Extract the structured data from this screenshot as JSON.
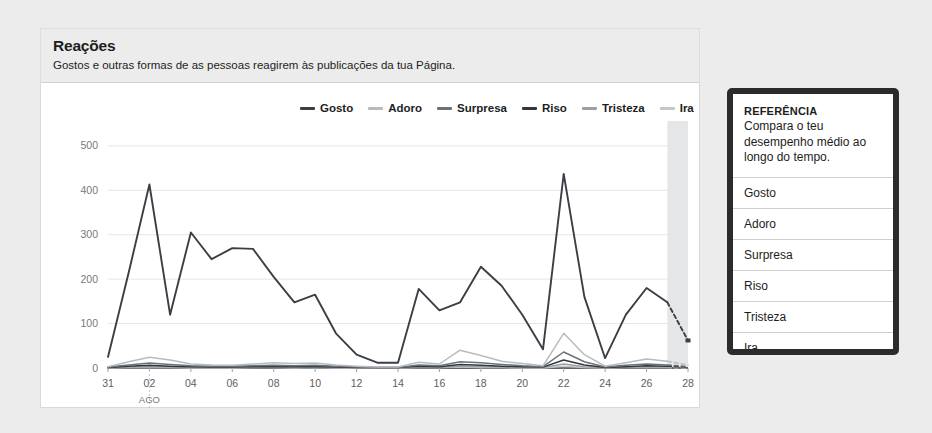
{
  "card": {
    "title": "Reações",
    "subtitle": "Gostos e outras formas de as pessoas reagirem às publicações da tua Página."
  },
  "reference_panel": {
    "title": "REFERÊNCIA",
    "description": "Compara o teu desempenho médio ao longo do tempo.",
    "rows": [
      {
        "label": "Gosto"
      },
      {
        "label": "Adoro"
      },
      {
        "label": "Surpresa"
      },
      {
        "label": "Riso"
      },
      {
        "label": "Tristeza"
      },
      {
        "label": "Ira"
      }
    ]
  },
  "colors": {
    "gosto": "#3b3f45",
    "adoro": "#b7bbc0",
    "surpresa": "#6d7276",
    "riso": "#33373c",
    "tristeza": "#9aa0a5",
    "ira": "#c3c7cb",
    "grid": "#e4e6e8",
    "axis": "#2f3135",
    "forecast_band": "#dcdee0"
  },
  "chart_data": {
    "type": "line",
    "title": "Reações",
    "xlabel": "",
    "ylabel": "",
    "ylim": [
      0,
      520
    ],
    "yticks": [
      0,
      100,
      200,
      300,
      400,
      500
    ],
    "grid": true,
    "legend_position": "top",
    "month_label": "AGO",
    "x": [
      "31",
      "01",
      "02",
      "03",
      "04",
      "05",
      "06",
      "07",
      "08",
      "09",
      "10",
      "11",
      "12",
      "13",
      "14",
      "15",
      "16",
      "17",
      "18",
      "19",
      "20",
      "21",
      "22",
      "23",
      "24",
      "25",
      "26",
      "27",
      "28"
    ],
    "xtick_labels": [
      "31",
      "02",
      "04",
      "06",
      "08",
      "10",
      "12",
      "14",
      "16",
      "18",
      "20",
      "22",
      "24",
      "26",
      "28"
    ],
    "forecast_band_range": [
      "27",
      "28"
    ],
    "dashed_tail_from": "27",
    "series": [
      {
        "name": "Gosto",
        "color": "#3b3f45",
        "values": [
          25,
          215,
          413,
          120,
          305,
          245,
          270,
          268,
          205,
          148,
          165,
          78,
          30,
          12,
          12,
          178,
          130,
          148,
          228,
          185,
          120,
          42,
          437,
          160,
          22,
          120,
          180,
          148,
          62
        ]
      },
      {
        "name": "Adoro",
        "color": "#b7bbc0",
        "values": [
          3,
          14,
          24,
          18,
          9,
          7,
          6,
          9,
          12,
          10,
          11,
          7,
          4,
          2,
          2,
          13,
          9,
          40,
          28,
          15,
          10,
          5,
          78,
          30,
          4,
          12,
          20,
          15,
          7
        ]
      },
      {
        "name": "Surpresa",
        "color": "#6d7276",
        "values": [
          2,
          7,
          11,
          8,
          5,
          4,
          4,
          5,
          6,
          5,
          6,
          4,
          2,
          1,
          1,
          7,
          5,
          14,
          12,
          8,
          5,
          3,
          36,
          14,
          2,
          6,
          9,
          7,
          3
        ]
      },
      {
        "name": "Riso",
        "color": "#33373c",
        "values": [
          1,
          4,
          6,
          4,
          3,
          2,
          2,
          3,
          3,
          3,
          3,
          2,
          1,
          1,
          1,
          4,
          3,
          8,
          6,
          4,
          3,
          2,
          18,
          7,
          1,
          3,
          5,
          4,
          2
        ]
      },
      {
        "name": "Tristeza",
        "color": "#9aa0a5",
        "values": [
          0,
          2,
          3,
          2,
          1,
          1,
          1,
          1,
          2,
          1,
          2,
          1,
          1,
          0,
          0,
          2,
          1,
          4,
          3,
          2,
          1,
          1,
          9,
          3,
          1,
          2,
          2,
          2,
          1
        ]
      },
      {
        "name": "Ira",
        "color": "#c3c7cb",
        "values": [
          0,
          1,
          1,
          1,
          0,
          0,
          0,
          1,
          1,
          0,
          1,
          0,
          0,
          0,
          0,
          1,
          1,
          2,
          1,
          1,
          0,
          0,
          4,
          1,
          0,
          1,
          1,
          1,
          0
        ]
      }
    ]
  }
}
